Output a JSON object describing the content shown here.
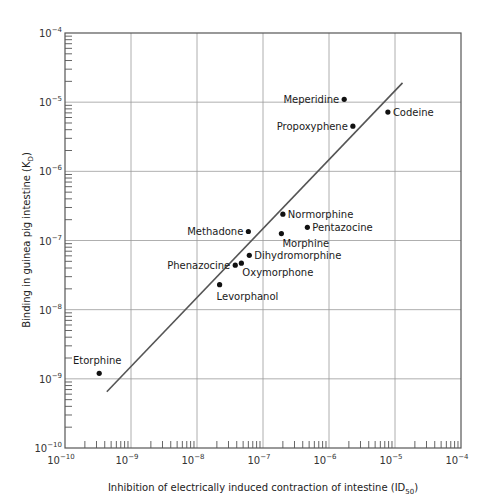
{
  "chart_data": {
    "type": "scatter",
    "title": "",
    "xlabel": "Inhibition of electrically induced contraction of intestine (ID50)",
    "xlabel_main": "Inhibition of electrically induced contraction of intestine (ID",
    "xlabel_sub": "50",
    "xlabel_end": ")",
    "ylabel": "Binding in guinea pig intestine (KD)",
    "ylabel_main": "Binding in guinea pig intestine (K",
    "ylabel_sub": "D",
    "ylabel_end": ")",
    "xscale": "log",
    "yscale": "log",
    "xlim": [
      1e-10,
      0.0001
    ],
    "ylim": [
      1e-10,
      0.0001
    ],
    "x_ticks": [
      {
        "base": "10",
        "exp": "−10"
      },
      {
        "base": "10",
        "exp": "−9"
      },
      {
        "base": "10",
        "exp": "−8"
      },
      {
        "base": "10",
        "exp": "−7"
      },
      {
        "base": "10",
        "exp": "−6"
      },
      {
        "base": "10",
        "exp": "−5"
      },
      {
        "base": "10",
        "exp": "−4"
      }
    ],
    "y_ticks": [
      {
        "base": "10",
        "exp": "−10"
      },
      {
        "base": "10",
        "exp": "−9"
      },
      {
        "base": "10",
        "exp": "−8"
      },
      {
        "base": "10",
        "exp": "−7"
      },
      {
        "base": "10",
        "exp": "−6"
      },
      {
        "base": "10",
        "exp": "−5"
      },
      {
        "base": "10",
        "exp": "−4"
      }
    ],
    "grid": true,
    "legend": null,
    "points": [
      {
        "name": "Etorphine",
        "x": 3.3e-10,
        "y": 1.2e-09,
        "label_pos": "above"
      },
      {
        "name": "Levorphanol",
        "x": 2.2e-08,
        "y": 2.3e-08,
        "label_pos": "below"
      },
      {
        "name": "Phenazocine",
        "x": 3.8e-08,
        "y": 4.4e-08,
        "label_pos": "left"
      },
      {
        "name": "Oxymorphone",
        "x": 4.7e-08,
        "y": 4.7e-08,
        "label_pos": "below-right"
      },
      {
        "name": "Dihydromorphine",
        "x": 6.2e-08,
        "y": 6.1e-08,
        "label_pos": "right"
      },
      {
        "name": "Methadone",
        "x": 6e-08,
        "y": 1.35e-07,
        "label_pos": "left"
      },
      {
        "name": "Normorphine",
        "x": 2e-07,
        "y": 2.4e-07,
        "label_pos": "right"
      },
      {
        "name": "Morphine",
        "x": 1.9e-07,
        "y": 1.26e-07,
        "label_pos": "below-right"
      },
      {
        "name": "Pentazocine",
        "x": 4.7e-07,
        "y": 1.55e-07,
        "label_pos": "right"
      },
      {
        "name": "Meperidine",
        "x": 1.7e-06,
        "y": 1.1e-05,
        "label_pos": "left"
      },
      {
        "name": "Propoxyphene",
        "x": 2.3e-06,
        "y": 4.5e-06,
        "label_pos": "left"
      },
      {
        "name": "Codeine",
        "x": 7.8e-06,
        "y": 7.2e-06,
        "label_pos": "right"
      }
    ],
    "fit_line": {
      "x1": 4.3e-10,
      "y1": 6.5e-10,
      "x2": 1.3e-05,
      "y2": 1.9e-05
    }
  },
  "colors": {
    "axis": "#555555",
    "grid": "#9a9a9a",
    "line": "#555555",
    "point": "#111111",
    "text": "#222222"
  }
}
